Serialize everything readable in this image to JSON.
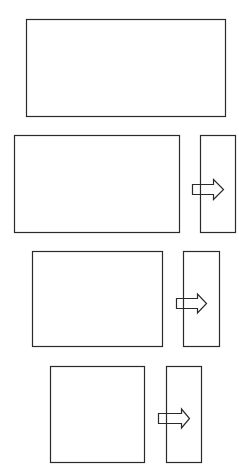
{
  "diagram": {
    "title": "",
    "canvas": {
      "width": 239,
      "height": 466,
      "background": "#ffffff"
    },
    "stroke_color": "#2a2a2a",
    "arrow_fill": "#ffffff",
    "groups": [
      {
        "id": "group-1",
        "main_panel": {
          "x": 26,
          "y": 19,
          "w": 199,
          "h": 97
        },
        "side_panel": null,
        "arrow": null
      },
      {
        "id": "group-2",
        "main_panel": {
          "x": 14,
          "y": 135,
          "w": 165,
          "h": 97
        },
        "side_panel": {
          "x": 200,
          "y": 135,
          "w": 35,
          "h": 97
        },
        "arrow": {
          "x": 192,
          "y_center": 189,
          "body_len": 21,
          "tip_x": 223,
          "body_h": 10,
          "head_h": 20,
          "direction": "right"
        }
      },
      {
        "id": "group-3",
        "main_panel": {
          "x": 32,
          "y": 251,
          "w": 130,
          "h": 95
        },
        "side_panel": {
          "x": 183,
          "y": 251,
          "w": 36,
          "h": 95
        },
        "arrow": {
          "x": 176,
          "y_center": 303,
          "body_len": 21,
          "tip_x": 206,
          "body_h": 10,
          "head_h": 19,
          "direction": "right"
        }
      },
      {
        "id": "group-4",
        "main_panel": {
          "x": 50,
          "y": 366,
          "w": 94,
          "h": 96
        },
        "side_panel": {
          "x": 166,
          "y": 366,
          "w": 35,
          "h": 96
        },
        "arrow": {
          "x": 158,
          "y_center": 418,
          "body_len": 23,
          "tip_x": 189,
          "body_h": 10,
          "head_h": 19,
          "direction": "right"
        }
      }
    ]
  }
}
